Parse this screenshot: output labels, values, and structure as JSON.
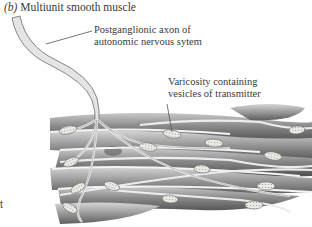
{
  "figure": {
    "panel_letter": "(b)",
    "title": "Multiunit smooth muscle",
    "labels": {
      "axon_line1": "Postganglionic axon of",
      "axon_line2": "autonomic nervous sytem",
      "varicosity_line1": "Varicosity containing",
      "varicosity_line2": "vesicles of transmitter"
    },
    "edge_fragment": "t"
  },
  "colors": {
    "background": "#ffffff",
    "axon_fill": "#e4e4e4",
    "axon_stroke": "#6a6a6a",
    "muscle_dark": "#6e6e6e",
    "muscle_light": "#bdbdbd",
    "varicosity": "#e8e6e0",
    "text": "#3a3a3a"
  }
}
